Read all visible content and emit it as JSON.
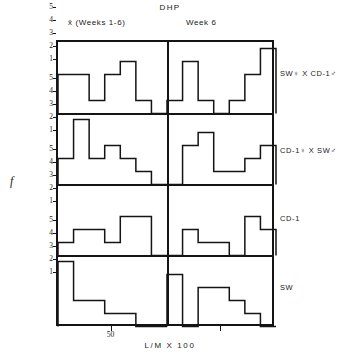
{
  "figure": {
    "title": "DHP",
    "y_axis_label": "f",
    "x_axis_label": "L/M X 100",
    "column_headers": [
      "x̄ (Weeks 1-6)",
      "Week 6"
    ],
    "row_labels": [
      "SW♀ X CD-1♂",
      "CD-1♀ X SW♂",
      "CD-1",
      "SW"
    ],
    "y_ticks": [
      "5",
      "4",
      "3",
      "2",
      "1"
    ],
    "x_ticks": [
      "50",
      "50"
    ],
    "line_color": "#141414",
    "background_color": "#ffffff"
  },
  "chart_data": {
    "type": "bar",
    "title": "DHP",
    "xlabel": "L/M X 100",
    "ylabel": "f",
    "ylim": [
      0,
      5.5
    ],
    "grid": false,
    "legend": "none",
    "note": "Grid of 4 rows x 2 columns of step-outline frequency histograms. Each panel has 7 equal-width bins along L/M X 100; the labelled 50 tick sits at bin 4 of 7.",
    "bin_count": 7,
    "x_tick_positions": [
      0.5
    ],
    "x_tick_labels": [
      "50"
    ],
    "columns": [
      {
        "name": "x̄ (Weeks 1-6)"
      },
      {
        "name": "Week 6"
      }
    ],
    "panels": [
      {
        "row": "SW♀ X CD-1♂",
        "column": "x̄ (Weeks 1-6)",
        "categories": [
          "1",
          "2",
          "3",
          "4",
          "5",
          "6",
          "7"
        ],
        "values": [
          3,
          3,
          1,
          3,
          4,
          1,
          0
        ]
      },
      {
        "row": "SW♀ X CD-1♂",
        "column": "Week 6",
        "categories": [
          "1",
          "2",
          "3",
          "4",
          "5",
          "6",
          "7"
        ],
        "values": [
          1,
          4,
          1,
          0,
          1,
          3,
          5
        ]
      },
      {
        "row": "CD-1♀ X SW♂",
        "column": "x̄ (Weeks 1-6)",
        "categories": [
          "1",
          "2",
          "3",
          "4",
          "5",
          "6",
          "7"
        ],
        "values": [
          2,
          5,
          2,
          3,
          2,
          1,
          0
        ]
      },
      {
        "row": "CD-1♀ X SW♂",
        "column": "Week 6",
        "categories": [
          "1",
          "2",
          "3",
          "4",
          "5",
          "6",
          "7"
        ],
        "values": [
          0,
          3,
          4,
          1,
          1,
          2,
          3
        ]
      },
      {
        "row": "CD-1",
        "column": "x̄ (Weeks 1-6)",
        "categories": [
          "1",
          "2",
          "3",
          "4",
          "5",
          "6",
          "7"
        ],
        "values": [
          1,
          2,
          2,
          1,
          3,
          3,
          0
        ]
      },
      {
        "row": "CD-1",
        "column": "Week 6",
        "categories": [
          "1",
          "2",
          "3",
          "4",
          "5",
          "6",
          "7"
        ],
        "values": [
          0,
          2,
          1,
          1,
          0,
          3,
          2
        ]
      },
      {
        "row": "SW",
        "column": "x̄ (Weeks 1-6)",
        "categories": [
          "1",
          "2",
          "3",
          "4",
          "5",
          "6",
          "7"
        ],
        "values": [
          5,
          2,
          2,
          1,
          1,
          0,
          0
        ]
      },
      {
        "row": "SW",
        "column": "Week 6",
        "categories": [
          "1",
          "2",
          "3",
          "4",
          "5",
          "6",
          "7"
        ],
        "values": [
          4,
          0,
          3,
          3,
          2,
          1,
          0
        ]
      }
    ]
  }
}
